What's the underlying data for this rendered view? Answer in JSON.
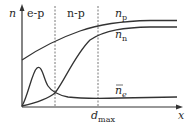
{
  "diagram": {
    "axes": {
      "y_label": "n",
      "x_label": "x"
    },
    "regions": [
      {
        "label": "e-p"
      },
      {
        "label": "n-p"
      }
    ],
    "markers": {
      "d_max_base": "d",
      "d_max_sub": "max"
    },
    "curves": [
      {
        "name": "n_p",
        "base": "n",
        "sub": "p"
      },
      {
        "name": "n_n",
        "base": "n",
        "sub": "n"
      },
      {
        "name": "n_e_bar",
        "base": "n",
        "sub": "e",
        "overbar": true
      }
    ],
    "colors": {
      "line": "#333333",
      "dashed": "#555555",
      "background": "#ffffff"
    }
  }
}
